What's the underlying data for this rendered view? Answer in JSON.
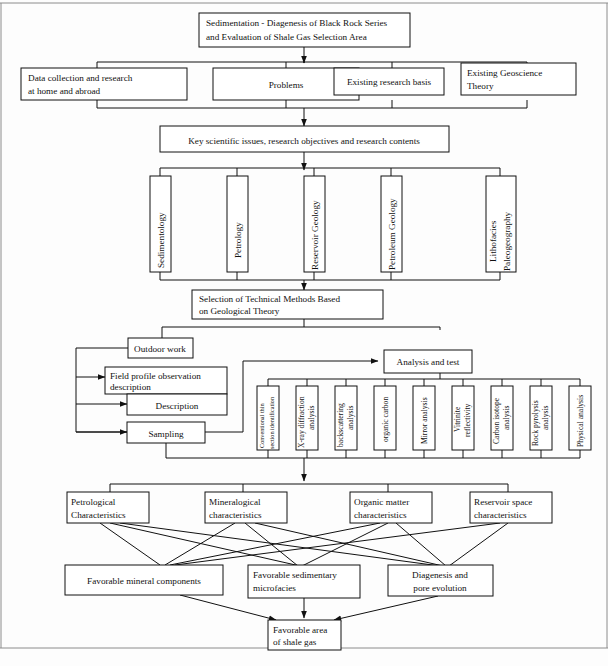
{
  "diagram": {
    "title_box": {
      "lines": [
        "Sedimentation - Diagenesis of Black Rock Series",
        "and Evaluation of Shale Gas Selection Area"
      ]
    },
    "background_row": [
      {
        "id": "data-collection",
        "lines": [
          "Data collection and research",
          "at home and abroad"
        ]
      },
      {
        "id": "problems",
        "lines": [
          "Problems"
        ]
      },
      {
        "id": "existing-research-basis",
        "lines": [
          "Existing research basis"
        ]
      },
      {
        "id": "existing-geoscience-theory",
        "lines": [
          "Existing Geoscience",
          "Theory"
        ]
      }
    ],
    "key_issues_box": {
      "lines": [
        "Key scientific issues, research objectives and research contents"
      ]
    },
    "disciplines": [
      {
        "id": "sedimentology",
        "lines": [
          "Sedimentology"
        ]
      },
      {
        "id": "petrology",
        "lines": [
          "Petrology"
        ]
      },
      {
        "id": "reservoir-geology",
        "lines": [
          "Reservoir Geology"
        ]
      },
      {
        "id": "petroleum-geology",
        "lines": [
          "Petroleum Geology"
        ]
      },
      {
        "id": "lithofacies-paleogeography",
        "lines": [
          "Lithofacies",
          "Paleogeography"
        ]
      }
    ],
    "technical_methods_box": {
      "lines": [
        "Selection of Technical Methods Based",
        "on Geological Theory"
      ]
    },
    "outdoor_work_box": {
      "lines": [
        "Outdoor work"
      ]
    },
    "analysis_and_test_box": {
      "lines": [
        "Analysis and test"
      ]
    },
    "field_tasks": [
      {
        "id": "field-profile-observation",
        "lines": [
          "Field profile observation",
          "description"
        ]
      },
      {
        "id": "description",
        "lines": [
          "Description"
        ]
      },
      {
        "id": "sampling",
        "lines": [
          "Sampling"
        ]
      }
    ],
    "analysis_methods": [
      {
        "id": "conventional-thin-section",
        "lines": [
          "Conventional thin",
          "section identification"
        ]
      },
      {
        "id": "xray-diffraction",
        "lines": [
          "X-ray diffraction",
          "analysis"
        ]
      },
      {
        "id": "backscattering",
        "lines": [
          "backscattering",
          "analysis"
        ]
      },
      {
        "id": "organic-carbon",
        "lines": [
          "organic carbon"
        ]
      },
      {
        "id": "mirror-analysis",
        "lines": [
          "Mirror analysis"
        ]
      },
      {
        "id": "vitrinite-reflectivity",
        "lines": [
          "Vitrinite",
          "reflectivity"
        ]
      },
      {
        "id": "carbon-isotope",
        "lines": [
          "Carbon isotope",
          "analysis"
        ]
      },
      {
        "id": "rock-pyrolysis",
        "lines": [
          "Rock pyrolysis",
          "analysis"
        ]
      },
      {
        "id": "physical-analysis",
        "lines": [
          "Physical analysis"
        ]
      }
    ],
    "characteristics": [
      {
        "id": "petrological-characteristics",
        "lines": [
          "Petrological",
          "Characteristics"
        ]
      },
      {
        "id": "mineralogical-characteristics",
        "lines": [
          "Mineralogical",
          "characteristics"
        ]
      },
      {
        "id": "organic-matter-characteristics",
        "lines": [
          "Organic matter",
          "characteristics"
        ]
      },
      {
        "id": "reservoir-space-characteristics",
        "lines": [
          "Reservoir space",
          "characteristics"
        ]
      }
    ],
    "favorable_factors": [
      {
        "id": "favorable-mineral-components",
        "lines": [
          "Favorable mineral components"
        ]
      },
      {
        "id": "favorable-sedimentary-microfacies",
        "lines": [
          "Favorable sedimentary",
          "microfacies"
        ]
      },
      {
        "id": "diagenesis-pore-evolution",
        "lines": [
          "Diagenesis and",
          "pore evolution"
        ]
      }
    ],
    "result_box": {
      "lines": [
        "Favorable area",
        "of shale gas"
      ]
    }
  },
  "style": {
    "box_fill": "#ffffff",
    "box_stroke": "#111111",
    "line_color": "#111111",
    "text_color": "#111111",
    "page_background": "#fdfdfd"
  }
}
